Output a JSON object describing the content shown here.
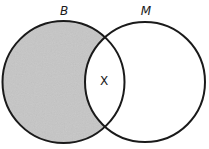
{
  "diagram": {
    "type": "venn",
    "sets": [
      {
        "id": "B",
        "label": "B",
        "shaded": "only-B region (B minus M)"
      },
      {
        "id": "M",
        "label": "M",
        "shaded": "none"
      }
    ],
    "regions": {
      "intersection_label": "X"
    },
    "colors": {
      "shade": "#c6c6c6",
      "stroke": "#1a1a1a",
      "background": "#ffffff"
    }
  }
}
